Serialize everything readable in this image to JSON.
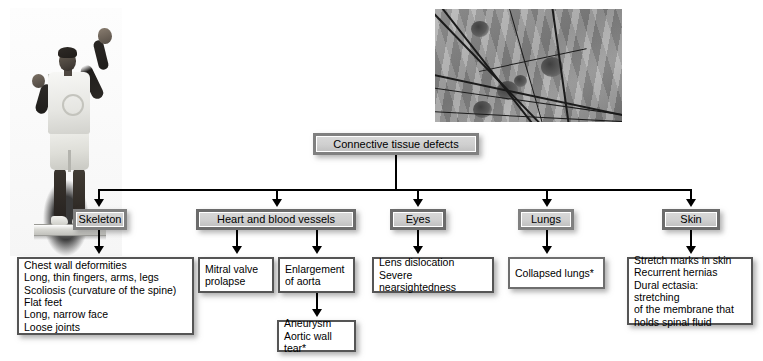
{
  "diagram": {
    "title": "Connective tissue defects",
    "root": {
      "label": "Connective tissue defects"
    },
    "images": [
      {
        "name": "person-photo",
        "alt": "Photograph of a tall thin person with arms raised standing on a platform"
      },
      {
        "name": "micrograph",
        "alt": "Grayscale micrograph of connective tissue fibers"
      }
    ],
    "categories": [
      {
        "id": "skeleton",
        "label": "Skeleton"
      },
      {
        "id": "heart",
        "label": "Heart and blood vessels"
      },
      {
        "id": "eyes",
        "label": "Eyes"
      },
      {
        "id": "lungs",
        "label": "Lungs"
      },
      {
        "id": "skin",
        "label": "Skin"
      }
    ],
    "details": [
      {
        "id": "skeleton-details",
        "parent": "skeleton",
        "text": "Chest wall deformities\nLong, thin fingers, arms, legs\nScoliosis (curvature of the spine)\nFlat feet\nLong, narrow face\nLoose joints"
      },
      {
        "id": "mitral-valve-prolapse",
        "parent": "heart",
        "text": "Mitral valve\nprolapse"
      },
      {
        "id": "enlargement-of-aorta",
        "parent": "heart",
        "text": "Enlargement\nof aorta"
      },
      {
        "id": "aneurysm",
        "parent": "enlargement-of-aorta",
        "text": "Aneurysm\nAortic wall tear*"
      },
      {
        "id": "eyes-details",
        "parent": "eyes",
        "text": "Lens dislocation\nSevere nearsightedness"
      },
      {
        "id": "lungs-details",
        "parent": "lungs",
        "text": "Collapsed lungs*"
      },
      {
        "id": "skin-details",
        "parent": "skin",
        "text": "Stretch marks in skin\nRecurrent hernias\nDural ectasia: stretching\n of the membrane that\n holds spinal fluid"
      }
    ],
    "colors": {
      "category_fill": "#cfcfcf",
      "category_border": "#808080",
      "detail_fill": "#ffffff",
      "detail_border": "#555555",
      "line": "#000000",
      "background": "#ffffff"
    }
  }
}
